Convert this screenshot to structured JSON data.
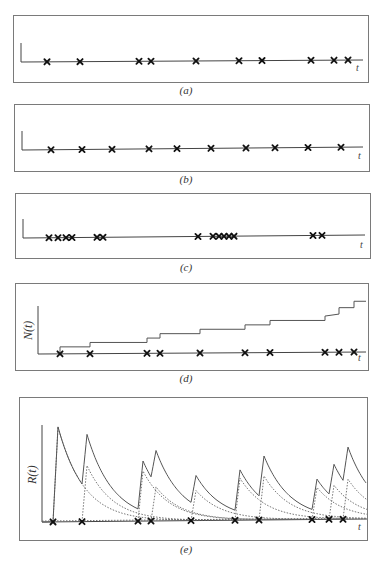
{
  "chart_data": [
    {
      "panel": "a",
      "type": "scatter",
      "title": "",
      "caption": "(a)",
      "xlabel": "t",
      "ylabel": "",
      "description": "Event times marked with crosses on a time axis (regular-ish Poisson-like spacing)",
      "events_x_px": [
        47,
        80,
        139,
        151,
        196,
        239,
        262,
        311,
        334,
        348
      ]
    },
    {
      "panel": "b",
      "type": "scatter",
      "caption": "(b)",
      "xlabel": "t",
      "ylabel": "",
      "description": "Evenly spaced event times on a time axis",
      "events_x_px": [
        51,
        82,
        112,
        149,
        177,
        211,
        246,
        275,
        308,
        341
      ]
    },
    {
      "panel": "c",
      "type": "scatter",
      "caption": "(c)",
      "xlabel": "t",
      "ylabel": "",
      "description": "Clustered (bursty) event times on a time axis",
      "events_x_px": [
        49,
        58,
        66,
        72,
        97,
        103,
        198,
        213,
        219,
        224,
        229,
        234,
        313,
        322
      ]
    },
    {
      "panel": "d",
      "type": "line",
      "caption": "(d)",
      "xlabel": "t",
      "ylabel": "N(t)",
      "description": "Counting process N(t): step function increasing by one at each event",
      "events_x_px": [
        60,
        90,
        147,
        160,
        200,
        245,
        270,
        325,
        339,
        354
      ],
      "step_values": [
        0,
        1,
        2,
        3,
        4,
        5,
        6,
        7,
        8,
        9,
        10
      ]
    },
    {
      "panel": "e",
      "type": "line",
      "caption": "(e)",
      "xlabel": "t",
      "ylabel": "R(t)",
      "description": "Rate R(t) (solid) as sum of exponentially decaying kernels (dotted) triggered at each event",
      "events_x_px": [
        53,
        82,
        138,
        151,
        191,
        235,
        259,
        312,
        329,
        343
      ]
    }
  ],
  "captions": {
    "a": "(a)",
    "b": "(b)",
    "c": "(c)",
    "d": "(d)",
    "e": "(e)"
  },
  "axes": {
    "t_label": "t",
    "n_label": "N(t)",
    "r_label": "R(t)"
  },
  "colors": {
    "frame": "#777777",
    "axis": "#444444",
    "marker": "#111111",
    "curve": "#555555",
    "dotted": "#666666"
  }
}
